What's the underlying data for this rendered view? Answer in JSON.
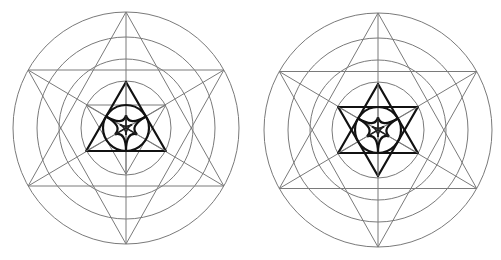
{
  "diagram": {
    "description": "Two sacred-geometry constructions side by side: concentric circles, hexagram and central trefoil within a circle",
    "colors": {
      "background": "#ffffff",
      "thin_line": "#7a7a7a",
      "bold_line": "#111111"
    },
    "figures": [
      {
        "id": "left",
        "center": [
          126,
          128
        ],
        "ring_radii": [
          113,
          89,
          67,
          45
        ],
        "outer_star": "hexagram",
        "inner_shape": "upright-triangle-bold-with-thin-inverted-triangle",
        "inner_circle_radius": 23,
        "motif": "trefoil"
      },
      {
        "id": "right",
        "center": [
          378,
          130
        ],
        "ring_radii": [
          114,
          90,
          68,
          46
        ],
        "outer_star": "hexagram",
        "inner_shape": "hexagram-bold",
        "inner_circle_radius": 23,
        "motif": "trefoil"
      }
    ]
  }
}
